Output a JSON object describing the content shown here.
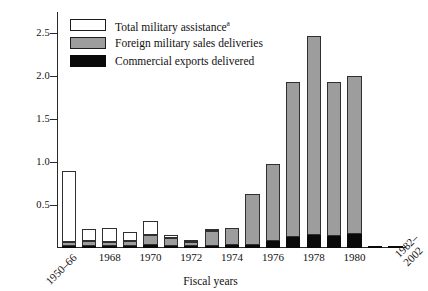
{
  "chart_data": {
    "type": "bar",
    "stacked": true,
    "title": "",
    "xlabel": "Fiscal years",
    "ylabel": "",
    "ylim": [
      0,
      2.75
    ],
    "yticks": [
      0.5,
      1.0,
      1.5,
      2.0,
      2.5
    ],
    "ytick_labels": [
      "0.5",
      "1.0",
      "1.5",
      "2.0",
      "2.5"
    ],
    "grid": false,
    "legend_position": "top-left",
    "categories": [
      "1950-66",
      "1967",
      "1968",
      "1969",
      "1970",
      "1971",
      "1972",
      "1973",
      "1974",
      "1975",
      "1976",
      "1977",
      "1978",
      "1979",
      "1980",
      "1981",
      "1982-2002"
    ],
    "tick_labels": [
      {
        "category": "1950-66",
        "text": "1950–66",
        "rotated": true
      },
      {
        "category": "1968",
        "text": "1968",
        "rotated": false
      },
      {
        "category": "1970",
        "text": "1970",
        "rotated": false
      },
      {
        "category": "1972",
        "text": "1972",
        "rotated": false
      },
      {
        "category": "1974",
        "text": "1974",
        "rotated": false
      },
      {
        "category": "1976",
        "text": "1976",
        "rotated": false
      },
      {
        "category": "1978",
        "text": "1978",
        "rotated": false
      },
      {
        "category": "1980",
        "text": "1980",
        "rotated": false
      },
      {
        "category": "1982-2002",
        "text": "1982–\n2002",
        "rotated": true
      }
    ],
    "series": [
      {
        "name": "Commercial exports delivered",
        "color": "#0a0a0a",
        "values": [
          0.02,
          0.02,
          0.02,
          0.02,
          0.03,
          0.02,
          0.02,
          0.02,
          0.03,
          0.03,
          0.08,
          0.13,
          0.15,
          0.14,
          0.16,
          0.01,
          0.01
        ]
      },
      {
        "name": "Foreign military sales deliveries",
        "color": "#9d9d9d",
        "values": [
          0.05,
          0.06,
          0.05,
          0.06,
          0.12,
          0.09,
          0.05,
          0.18,
          0.2,
          0.6,
          0.9,
          1.8,
          2.32,
          1.8,
          1.84,
          0.0,
          0.0
        ]
      },
      {
        "name": "Total military assistance",
        "color": "#ffffff",
        "values": [
          0.83,
          0.14,
          0.16,
          0.1,
          0.16,
          0.04,
          0.02,
          0.02,
          0.0,
          0.0,
          0.0,
          0.0,
          0.0,
          0.0,
          0.0,
          0.0,
          0.0
        ]
      }
    ],
    "totals": [
      0.9,
      0.22,
      0.23,
      0.18,
      0.31,
      0.15,
      0.09,
      0.22,
      0.23,
      0.63,
      0.98,
      1.93,
      2.47,
      1.94,
      2.0,
      0.01,
      0.01
    ]
  },
  "legend": {
    "items": [
      {
        "label": "Total military assistance",
        "superscript": "a",
        "swatch": "white"
      },
      {
        "label": "Foreign military sales deliveries",
        "superscript": "",
        "swatch": "gray"
      },
      {
        "label": "Commercial exports delivered",
        "superscript": "",
        "swatch": "black"
      }
    ]
  },
  "axis": {
    "x_title": "Fiscal years"
  }
}
